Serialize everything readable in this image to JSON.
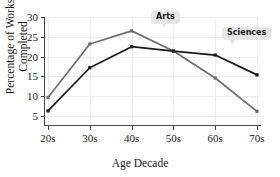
{
  "chart_data": {
    "type": "line",
    "title": "",
    "xlabel": "Age Decade",
    "ylabel": "Percentage of Works\nCompleted",
    "categories": [
      "20s",
      "30s",
      "40s",
      "50s",
      "60s",
      "70s"
    ],
    "yticks": [
      5,
      10,
      15,
      20,
      25,
      30
    ],
    "ylim": [
      3,
      30
    ],
    "grid": true,
    "legend": "annotated-callouts",
    "series": [
      {
        "name": "Arts",
        "color": "#6e6e6e",
        "values": [
          9.7,
          23.2,
          26.5,
          21.4,
          14.6,
          6.2
        ]
      },
      {
        "name": "Sciences",
        "color": "#1a1a1a",
        "values": [
          6.3,
          17.2,
          22.5,
          21.4,
          20.4,
          15.4
        ]
      }
    ],
    "annotations": [
      {
        "label": "Arts",
        "target_series": "Arts",
        "target_category": "40s"
      },
      {
        "label": "Sciences",
        "target_series": "Sciences",
        "target_category": "60s"
      }
    ]
  },
  "colors": {
    "arts": "#6e6e6e",
    "sciences": "#1a1a1a",
    "axis": "#4a4a4a",
    "grid": "#ededed",
    "callout_bg": "#e6e6e6"
  }
}
